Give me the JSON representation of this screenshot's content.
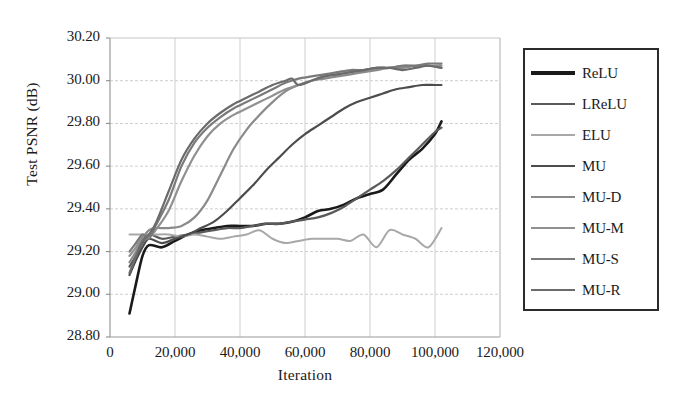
{
  "chart_data": {
    "type": "line",
    "title": "",
    "xlabel": "Iteration",
    "ylabel": "Test PSNR (dB)",
    "xlim": [
      0,
      120000
    ],
    "ylim": [
      28.8,
      30.2
    ],
    "xticks": [
      "0",
      "20,000",
      "40,000",
      "60,000",
      "80,000",
      "100,000",
      "120,000"
    ],
    "xtick_values": [
      0,
      20000,
      40000,
      60000,
      80000,
      100000,
      120000
    ],
    "yticks": [
      "28.80",
      "29.00",
      "29.20",
      "29.40",
      "29.60",
      "29.80",
      "30.00",
      "30.20"
    ],
    "ytick_values": [
      28.8,
      29.0,
      29.2,
      29.4,
      29.6,
      29.8,
      30.0,
      30.2
    ],
    "grid": true,
    "legend_position": "right-outside",
    "series": [
      {
        "name": "ReLU",
        "color": "#1a1a1a",
        "width": 2.6,
        "x": [
          6000,
          8000,
          10000,
          12000,
          16000,
          20000,
          24000,
          28000,
          32000,
          36000,
          40000,
          44000,
          48000,
          52000,
          56000,
          60000,
          64000,
          68000,
          72000,
          76000,
          80000,
          84000,
          88000,
          92000,
          96000,
          100000,
          102000
        ],
        "y": [
          28.91,
          29.05,
          29.18,
          29.23,
          29.22,
          29.25,
          29.28,
          29.3,
          29.31,
          29.32,
          29.32,
          29.32,
          29.33,
          29.33,
          29.34,
          29.36,
          29.39,
          29.4,
          29.42,
          29.45,
          29.47,
          29.49,
          29.56,
          29.63,
          29.68,
          29.75,
          29.81
        ]
      },
      {
        "name": "LReLU",
        "color": "#5a5a5a",
        "width": 2.2,
        "x": [
          6000,
          8000,
          10000,
          12000,
          16000,
          20000,
          24000,
          28000,
          32000,
          36000,
          40000,
          44000,
          48000,
          52000,
          56000,
          60000,
          64000,
          68000,
          72000,
          76000,
          80000,
          84000,
          88000,
          92000,
          96000,
          100000,
          102000
        ],
        "y": [
          29.13,
          29.18,
          29.24,
          29.28,
          29.26,
          29.27,
          29.28,
          29.29,
          29.3,
          29.31,
          29.31,
          29.32,
          29.33,
          29.33,
          29.34,
          29.35,
          29.36,
          29.38,
          29.41,
          29.45,
          29.49,
          29.53,
          29.58,
          29.64,
          29.7,
          29.76,
          29.78
        ]
      },
      {
        "name": "ELU",
        "color": "#a8a8a8",
        "width": 2.0,
        "x": [
          6000,
          10000,
          14000,
          18000,
          22000,
          26000,
          30000,
          34000,
          38000,
          42000,
          46000,
          50000,
          54000,
          58000,
          62000,
          66000,
          70000,
          74000,
          78000,
          82000,
          86000,
          90000,
          94000,
          98000,
          102000
        ],
        "y": [
          29.28,
          29.28,
          29.28,
          29.28,
          29.27,
          29.28,
          29.27,
          29.26,
          29.27,
          29.28,
          29.3,
          29.26,
          29.24,
          29.25,
          29.26,
          29.26,
          29.26,
          29.25,
          29.28,
          29.22,
          29.3,
          29.28,
          29.26,
          29.22,
          29.31
        ]
      },
      {
        "name": "MU",
        "color": "#4d4d4d",
        "width": 2.2,
        "x": [
          6000,
          8000,
          10000,
          12000,
          16000,
          20000,
          24000,
          28000,
          32000,
          36000,
          40000,
          44000,
          48000,
          52000,
          56000,
          60000,
          64000,
          68000,
          72000,
          76000,
          80000,
          84000,
          88000,
          92000,
          96000,
          100000,
          102000
        ],
        "y": [
          29.09,
          29.16,
          29.22,
          29.26,
          29.24,
          29.26,
          29.28,
          29.31,
          29.34,
          29.39,
          29.45,
          29.51,
          29.58,
          29.64,
          29.7,
          29.75,
          29.79,
          29.83,
          29.87,
          29.9,
          29.92,
          29.94,
          29.96,
          29.97,
          29.98,
          29.98,
          29.98
        ]
      },
      {
        "name": "MU-D",
        "color": "#8a8a8a",
        "width": 2.2,
        "x": [
          6000,
          8000,
          10000,
          12000,
          14000,
          18000,
          22000,
          26000,
          30000,
          34000,
          38000,
          42000,
          46000,
          50000,
          54000,
          58000,
          62000,
          66000,
          70000,
          74000,
          78000,
          82000,
          86000,
          90000,
          94000,
          98000,
          102000
        ],
        "y": [
          29.15,
          29.2,
          29.26,
          29.3,
          29.31,
          29.31,
          29.32,
          29.36,
          29.44,
          29.56,
          29.68,
          29.77,
          29.84,
          29.9,
          29.95,
          29.98,
          30.0,
          30.01,
          30.02,
          30.03,
          30.04,
          30.05,
          30.06,
          30.06,
          30.07,
          30.07,
          30.06
        ]
      },
      {
        "name": "MU-M",
        "color": "#909090",
        "width": 2.2,
        "x": [
          6000,
          8000,
          10000,
          12000,
          14000,
          18000,
          22000,
          26000,
          30000,
          34000,
          38000,
          42000,
          46000,
          50000,
          54000,
          58000,
          62000,
          66000,
          70000,
          74000,
          78000,
          82000,
          86000,
          90000,
          94000,
          98000,
          102000
        ],
        "y": [
          29.18,
          29.22,
          29.27,
          29.27,
          29.3,
          29.39,
          29.53,
          29.65,
          29.74,
          29.8,
          29.84,
          29.87,
          29.9,
          29.93,
          29.96,
          29.98,
          30.0,
          30.02,
          30.03,
          30.04,
          30.05,
          30.06,
          30.06,
          30.07,
          30.07,
          30.07,
          30.07
        ]
      },
      {
        "name": "MU-S",
        "color": "#7a7a7a",
        "width": 2.2,
        "x": [
          6000,
          8000,
          10000,
          12000,
          14000,
          18000,
          22000,
          26000,
          30000,
          34000,
          38000,
          42000,
          46000,
          50000,
          54000,
          58000,
          62000,
          66000,
          70000,
          74000,
          78000,
          82000,
          86000,
          90000,
          94000,
          98000,
          102000
        ],
        "y": [
          29.2,
          29.24,
          29.28,
          29.26,
          29.32,
          29.44,
          29.6,
          29.71,
          29.78,
          29.83,
          29.87,
          29.9,
          29.93,
          29.96,
          29.99,
          30.01,
          30.02,
          30.03,
          30.04,
          30.05,
          30.05,
          30.06,
          30.06,
          30.07,
          30.07,
          30.08,
          30.08
        ]
      },
      {
        "name": "MU-R",
        "color": "#6b6b6b",
        "width": 2.2,
        "x": [
          6000,
          8000,
          10000,
          12000,
          14000,
          18000,
          22000,
          26000,
          30000,
          34000,
          38000,
          42000,
          46000,
          50000,
          54000,
          56000,
          58000,
          62000,
          66000,
          70000,
          74000,
          78000,
          82000,
          86000,
          90000,
          94000,
          98000,
          102000
        ],
        "y": [
          29.1,
          29.18,
          29.25,
          29.28,
          29.33,
          29.48,
          29.63,
          29.73,
          29.8,
          29.85,
          29.89,
          29.92,
          29.95,
          29.98,
          30.0,
          30.01,
          29.98,
          30.0,
          30.02,
          30.03,
          30.04,
          30.05,
          30.06,
          30.06,
          30.05,
          30.06,
          30.07,
          30.06
        ]
      }
    ]
  },
  "legend": {
    "items": [
      {
        "label": "ReLU"
      },
      {
        "label": "LReLU"
      },
      {
        "label": "ELU"
      },
      {
        "label": "MU"
      },
      {
        "label": "MU-D"
      },
      {
        "label": "MU-M"
      },
      {
        "label": "MU-S"
      },
      {
        "label": "MU-R"
      }
    ]
  },
  "axes": {
    "x_title": "Iteration",
    "y_title": "Test PSNR (dB)"
  },
  "style": {
    "plot_border": "#8c8c8c",
    "grid_color": "#cfcfcf",
    "background": "#ffffff"
  }
}
